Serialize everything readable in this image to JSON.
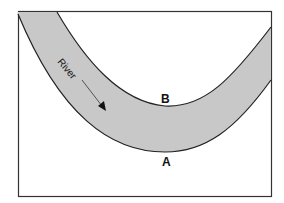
{
  "diagram": {
    "river_label": "River",
    "point_b": "B",
    "point_a": "A",
    "colors": {
      "river_fill": "#c8c8c8",
      "outline": "#222222",
      "background": "#ffffff"
    }
  }
}
